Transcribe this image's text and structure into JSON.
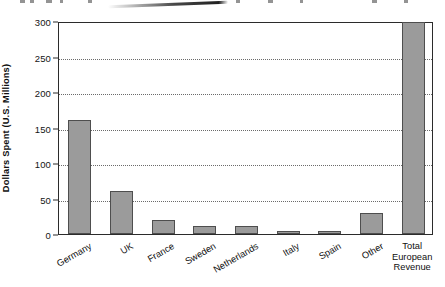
{
  "figure": {
    "top_artifact_present": true,
    "bar_fill_color": "#9b9b9b",
    "bar_border_color": "#4e4e4e",
    "frame_color": "#2b2b2b",
    "gridline_color": "#6b6b6b",
    "background_color": "#ffffff"
  },
  "chart_data": {
    "type": "bar",
    "title": "",
    "subtitle": "",
    "xlabel": "",
    "ylabel": "Dollars Spent (U.S. Millions)",
    "categories": [
      "Germany",
      "UK",
      "France",
      "Sweden",
      "Netherlands",
      "Italy",
      "Spain",
      "Other",
      "Total European Revenue"
    ],
    "category_display": [
      "Germany",
      "UK",
      "France",
      "Sweden",
      "Netherlands",
      "Italy",
      "Spain",
      "Other",
      "Total\nEuropean\nRevenue"
    ],
    "values": [
      160,
      60,
      20,
      11,
      11,
      4,
      4,
      30,
      298
    ],
    "ylim": [
      0,
      300
    ],
    "yticks": [
      0,
      50,
      100,
      150,
      200,
      250,
      300
    ],
    "ytick_labels": [
      "0",
      "50",
      "100",
      "150",
      "200",
      "250",
      "300"
    ],
    "grid": true,
    "grid_axis": "y",
    "grid_style": "dotted",
    "legend": null,
    "legend_position": "none",
    "annotations": [],
    "xtick_rotation_deg": -30,
    "last_label_rotation_deg": 0
  }
}
